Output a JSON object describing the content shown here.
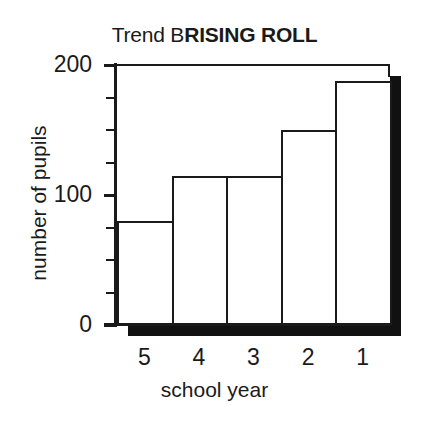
{
  "chart_data": {
    "type": "bar",
    "title_regular": "Trend B",
    "title_bold": "RISING ROLL",
    "xlabel": "school year",
    "ylabel": "number of pupils",
    "categories": [
      "5",
      "4",
      "3",
      "2",
      "1"
    ],
    "values": [
      80,
      115,
      115,
      150,
      188
    ],
    "ylim": [
      0,
      200
    ],
    "ytick_major": [
      0,
      100,
      200
    ],
    "ytick_major_labels": [
      "0",
      "100",
      "200"
    ],
    "ytick_minor_step": 25,
    "grid": false,
    "legend": null,
    "bar_fill": "#ffffff",
    "bar_edge": "#1a1a1a",
    "shadow_color": "#111111"
  }
}
